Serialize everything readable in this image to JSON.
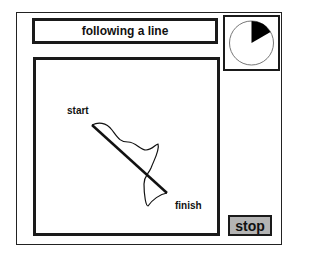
{
  "title": "following a line",
  "timer": {
    "icon": "pie-timer-icon",
    "elapsed_fraction": 0.17,
    "wedge_color": "#000000"
  },
  "canvas": {
    "start_label": "start",
    "finish_label": "finish",
    "target_line": {
      "x1": 56,
      "y1": 65,
      "x2": 131,
      "y2": 133
    },
    "traced_path_color": "#111111"
  },
  "controls": {
    "stop_label": "stop",
    "stop_bg": "#b4b4b4"
  }
}
